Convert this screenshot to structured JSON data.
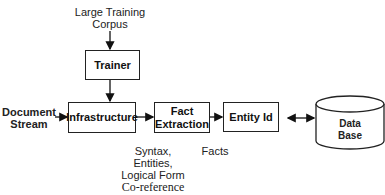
{
  "diagram": {
    "inputs": {
      "corpus": [
        "Large Training",
        "Corpus"
      ],
      "document_stream": [
        "Document",
        "Stream"
      ]
    },
    "nodes": {
      "trainer": "Trainer",
      "infrastructure": "Infrastructure",
      "fact_extraction": [
        "Fact",
        "Extraction"
      ],
      "entity_id": "Entity Id",
      "database": [
        "Data",
        "Base"
      ]
    },
    "annotations": {
      "infrastructure_output": [
        "Syntax,",
        "Entities,",
        "Logical Form"
      ],
      "coreference": "Co-reference",
      "facts": "Facts"
    },
    "edges": [
      {
        "from": "corpus",
        "to": "trainer"
      },
      {
        "from": "trainer",
        "to": "infrastructure"
      },
      {
        "from": "document_stream",
        "to": "infrastructure"
      },
      {
        "from": "infrastructure",
        "to": "fact_extraction"
      },
      {
        "from": "fact_extraction",
        "to": "entity_id"
      },
      {
        "from": "entity_id",
        "to": "database",
        "bidirectional": true
      }
    ]
  }
}
